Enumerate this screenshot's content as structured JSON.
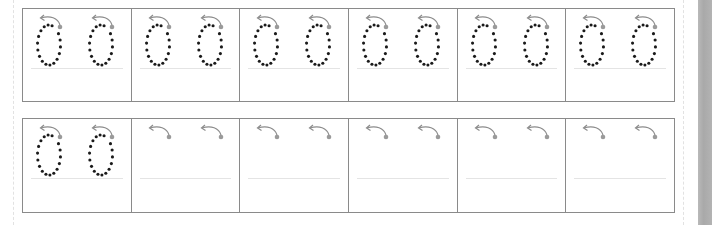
{
  "worksheet": {
    "type": "handwriting-tracing",
    "character": "0",
    "rows": [
      {
        "cells": [
          {
            "glyphs": [
              "traced",
              "traced"
            ]
          },
          {
            "glyphs": [
              "traced",
              "traced"
            ]
          },
          {
            "glyphs": [
              "traced",
              "traced"
            ]
          },
          {
            "glyphs": [
              "traced",
              "traced"
            ]
          },
          {
            "glyphs": [
              "traced",
              "traced"
            ]
          },
          {
            "glyphs": [
              "traced",
              "traced"
            ]
          }
        ]
      },
      {
        "cells": [
          {
            "glyphs": [
              "traced",
              "traced"
            ]
          },
          {
            "glyphs": [
              "start-only",
              "start-only"
            ]
          },
          {
            "glyphs": [
              "start-only",
              "start-only"
            ]
          },
          {
            "glyphs": [
              "start-only",
              "start-only"
            ]
          },
          {
            "glyphs": [
              "start-only",
              "start-only"
            ]
          },
          {
            "glyphs": [
              "start-only",
              "start-only"
            ]
          }
        ]
      }
    ],
    "colors": {
      "dot": "#1a1a1a",
      "start_dot": "#9a9a9a",
      "arrow": "#8c8c8c",
      "grid_line": "#8a8a8a",
      "baseline": "#e4e4e4"
    },
    "icons": {
      "direction": "counterclockwise-arrow-icon",
      "start": "start-point-dot-icon"
    }
  }
}
